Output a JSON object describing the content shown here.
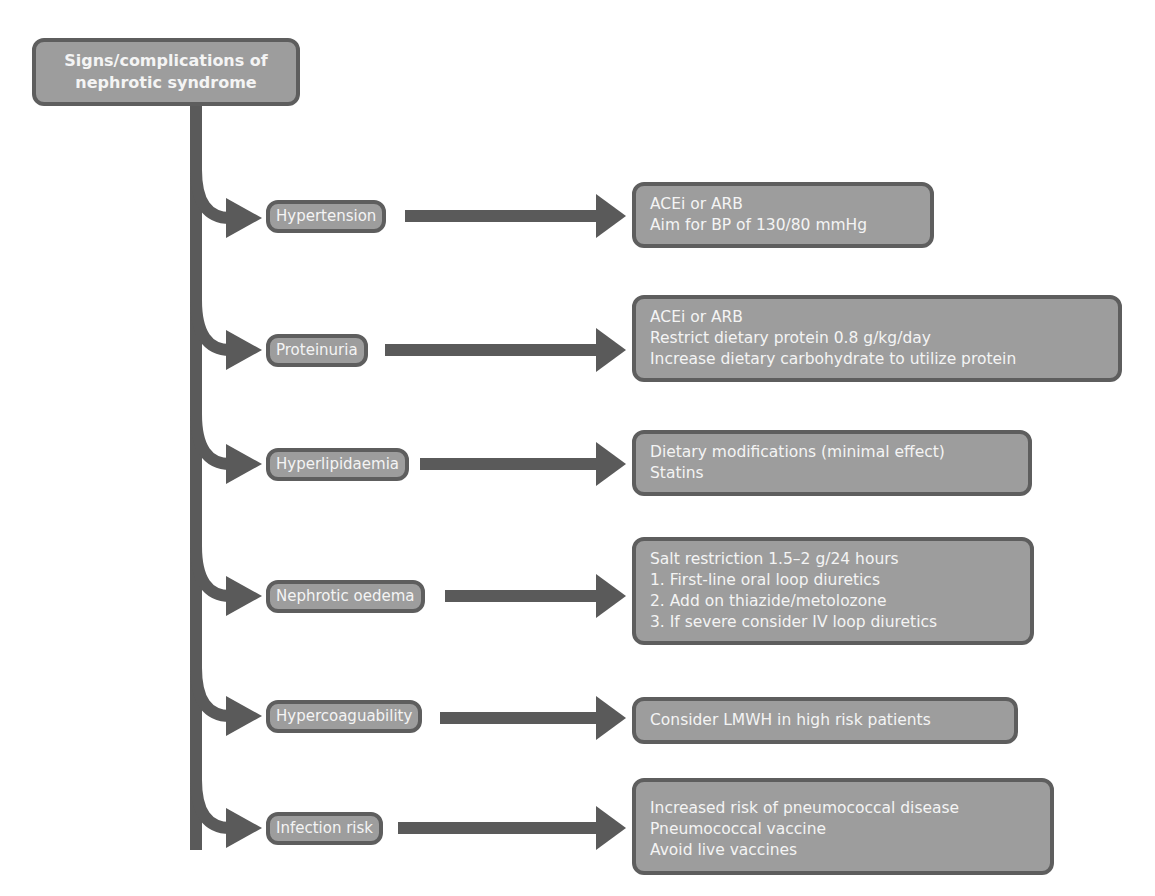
{
  "diagram": {
    "root": {
      "lines": [
        "Signs/complications of",
        "nephrotic syndrome"
      ]
    },
    "branches": [
      {
        "sign": "Hypertension",
        "treatments": [
          "ACEi or ARB",
          "Aim for BP of 130/80 mmHg"
        ]
      },
      {
        "sign": "Proteinuria",
        "treatments": [
          "ACEi or ARB",
          "Restrict dietary protein 0.8 g/kg/day",
          "Increase dietary carbohydrate to utilize protein"
        ]
      },
      {
        "sign": "Hyperlipidaemia",
        "treatments": [
          "Dietary modifications (minimal effect)",
          "Statins"
        ]
      },
      {
        "sign": "Nephrotic oedema",
        "treatments": [
          "Salt restriction 1.5–2 g/24 hours",
          "1. First-line oral loop diuretics",
          "2. Add on thiazide/metolozone",
          "3. If severe consider IV loop diuretics"
        ]
      },
      {
        "sign": "Hypercoaguability",
        "treatments": [
          "Consider LMWH in high risk patients"
        ]
      },
      {
        "sign": "Infection risk",
        "treatments": [
          "Increased risk of pneumococcal disease",
          "Pneumococcal vaccine",
          "Avoid live vaccines"
        ]
      }
    ],
    "colors": {
      "box_fill": "#9d9d9d",
      "box_border": "#5e5e5e",
      "connector": "#5a5a5a",
      "text": "#f4f4f4"
    }
  }
}
